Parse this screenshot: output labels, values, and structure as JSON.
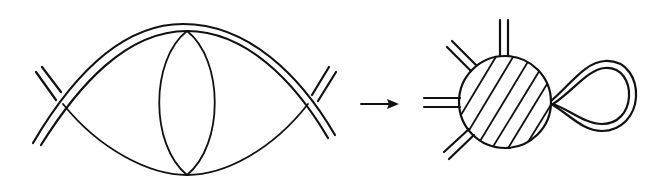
{
  "figure": {
    "description": "Feynman-type diagram reduction: a two-loop diagram with double-line propagators reduces to an effective vertex (hatched blob) with a tadpole loop",
    "left_diagram": {
      "name": "two-loop-diagram",
      "elements": [
        "double-line outer arc",
        "inner arc",
        "lens-shaped vertical loop",
        "two crossing double-line external legs"
      ]
    },
    "arrow": {
      "name": "reduction-arrow",
      "direction": "right"
    },
    "right_diagram": {
      "name": "effective-vertex",
      "elements": [
        "hatched blob",
        "four double-line external legs",
        "double-line tadpole loop"
      ],
      "hatch_lines": 6
    },
    "colors": {
      "stroke": "#111111",
      "background": "#ffffff"
    }
  }
}
